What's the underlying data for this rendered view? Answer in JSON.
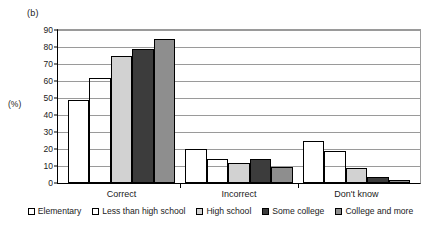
{
  "panel_label": "(b)",
  "y_axis_label": "(%)",
  "chart_data": {
    "type": "bar",
    "title": "",
    "subtitle": "",
    "xlabel": "",
    "ylabel": "(%)",
    "ylim": [
      0,
      90
    ],
    "yticks": [
      0,
      10,
      20,
      30,
      40,
      50,
      60,
      70,
      80,
      90
    ],
    "ytick_labels": [
      "0",
      "10",
      "20",
      "30",
      "40",
      "50",
      "60",
      "70",
      "80",
      "90"
    ],
    "grid": true,
    "legend_position": "bottom",
    "categories": [
      "Correct",
      "Incorrect",
      "Don't know"
    ],
    "series": [
      {
        "name": "Elementary",
        "color": "#ffffff",
        "values": [
          49,
          20,
          25
        ]
      },
      {
        "name": "Less than high school",
        "color": "#101010",
        "values": [
          62,
          14,
          19
        ]
      },
      {
        "name": "High school",
        "color": "#d2d2d2",
        "values": [
          75,
          12,
          9
        ]
      },
      {
        "name": "Some college",
        "color": "#3c3c3c",
        "values": [
          79,
          14,
          3.5
        ]
      },
      {
        "name": "College and more",
        "color": "#8e8e8e",
        "values": [
          85,
          9.5,
          2
        ]
      }
    ]
  }
}
